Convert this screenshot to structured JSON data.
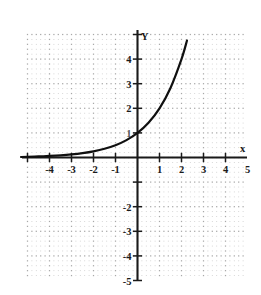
{
  "figure": {
    "name": "exponential-function-graph",
    "background_color": "#ffffff",
    "grid_color": "#c8c8c8",
    "axis_color": "#1a1a1a",
    "curve_color": "#101010"
  },
  "chart_data": {
    "type": "line",
    "title": "",
    "subtitle": "",
    "xlabel": "x",
    "ylabel": "Y",
    "xlim": [
      -5,
      5
    ],
    "ylim": [
      -5,
      5
    ],
    "grid": true,
    "grid_style": "dotted",
    "legend": null,
    "legend_position": "none",
    "x_tick_labels": [
      "-4",
      "-3",
      "-2",
      "-1",
      "1",
      "2",
      "3",
      "4",
      "5"
    ],
    "x_tick_values": [
      -4,
      -3,
      -2,
      -1,
      1,
      2,
      3,
      4,
      5
    ],
    "y_tick_labels": [
      "4",
      "3",
      "2",
      "1",
      "-2",
      "-3",
      "-4",
      "-5"
    ],
    "y_tick_values": [
      4,
      3,
      2,
      1,
      -2,
      -3,
      -4,
      -5
    ],
    "series": [
      {
        "name": "y = 2^x",
        "equation": "y = 2^x",
        "x": [
          -5.0,
          -4.5,
          -4.0,
          -3.5,
          -3.0,
          -2.5,
          -2.0,
          -1.5,
          -1.0,
          -0.5,
          0.0,
          0.5,
          1.0,
          1.5,
          2.0,
          2.25,
          2.4
        ],
        "values": [
          0.031,
          0.044,
          0.063,
          0.088,
          0.125,
          0.177,
          0.25,
          0.354,
          0.5,
          0.707,
          1.0,
          1.414,
          2.0,
          2.828,
          4.0,
          4.757,
          5.28
        ],
        "y_intercept": 1.0,
        "asymptote": "y = 0"
      }
    ],
    "annotations": []
  },
  "axis_labels": {
    "y_axis_name": "Y",
    "x_axis_name": "x"
  }
}
